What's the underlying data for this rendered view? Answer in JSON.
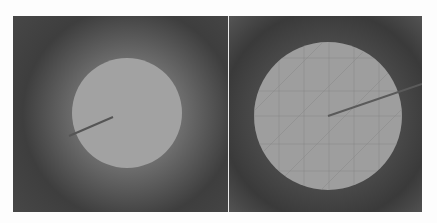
{
  "figure": {
    "panels": [
      {
        "id": "left",
        "background_color": "#3e3e3e",
        "disc": {
          "cx": 114,
          "cy": 97,
          "r": 55,
          "color": "#a2a2a2"
        },
        "needle": {
          "x1": 100,
          "y1": 101,
          "x2": 56,
          "y2": 120,
          "color": "#555555"
        },
        "grid": false
      },
      {
        "id": "right",
        "background_color": "#3a3a3a",
        "disc": {
          "cx": 99,
          "cy": 100,
          "r": 74,
          "color": "#9e9e9e"
        },
        "needle": {
          "x1": 99,
          "y1": 100,
          "x2": 193,
          "y2": 68,
          "color": "#5a5a5a"
        },
        "grid": true
      }
    ],
    "divider_color": "#eaeaea"
  }
}
